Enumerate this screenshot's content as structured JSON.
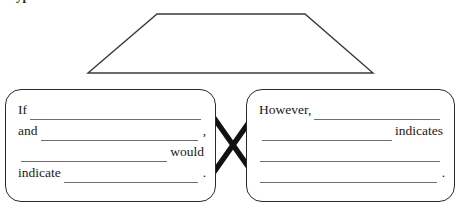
{
  "page": {
    "title_clipped": "Hypothesis",
    "background_color": "#ffffff",
    "ink_color": "#2a2a2a",
    "rule_color": "#6e6e6e"
  },
  "diagram": {
    "shape_label": "trapezoid",
    "connector_label": "x-crossover"
  },
  "left_box": {
    "name": "if-then-clause-box",
    "lines": [
      {
        "lead": "If",
        "trail": "",
        "punct": ""
      },
      {
        "lead": "and",
        "trail": "",
        "punct": ","
      },
      {
        "lead": "",
        "trail": "would",
        "punct": ""
      },
      {
        "lead": "indicate",
        "trail": "",
        "punct": "."
      }
    ]
  },
  "right_box": {
    "name": "however-clause-box",
    "lines": [
      {
        "lead": "However,",
        "trail": "",
        "punct": ""
      },
      {
        "lead": "",
        "trail": "indicates",
        "punct": ""
      },
      {
        "lead": "",
        "trail": "",
        "punct": ""
      },
      {
        "lead": "",
        "trail": "",
        "punct": "."
      }
    ]
  }
}
